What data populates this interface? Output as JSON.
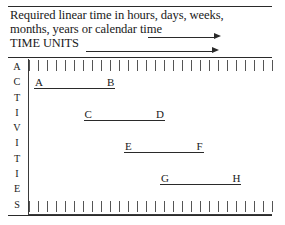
{
  "header": {
    "line1": "Required linear time in hours, days, weeks,",
    "line2": "months, years or calendar time",
    "line3": "TIME UNITS",
    "arrow1_name": "right-arrow",
    "arrow2_name": "right-arrow"
  },
  "axis": {
    "vertical_label": "ACTIVITIES",
    "vertical_letters": [
      "A",
      "C",
      "T",
      "I",
      "V",
      "I",
      "T",
      "I",
      "E",
      "S"
    ],
    "top_tick_count": 27,
    "bottom_tick_count": 27
  },
  "chart_data": {
    "type": "bar",
    "title": "Required linear time in hours, days, weeks, months, years or calendar time",
    "xlabel": "TIME UNITS",
    "ylabel": "ACTIVITIES",
    "grid": false,
    "legend": "none",
    "xlim": [
      0,
      27
    ],
    "categories": [
      "A-B",
      "C-D",
      "E-F",
      "G-H"
    ],
    "bars": [
      {
        "start_label": "A",
        "end_label": "B",
        "start": 0.6,
        "end": 9.6,
        "row": 0
      },
      {
        "start_label": "C",
        "end_label": "D",
        "start": 6.1,
        "end": 15.1,
        "row": 1
      },
      {
        "start_label": "E",
        "end_label": "F",
        "start": 10.6,
        "end": 19.4,
        "row": 2
      },
      {
        "start_label": "G",
        "end_label": "H",
        "start": 14.6,
        "end": 23.6,
        "row": 3
      }
    ],
    "annotations": [
      "Horizontal span bars represent activity durations along a linear time axis.",
      "Each bar is labelled at its start and end point."
    ]
  },
  "colors": {
    "ink": "#1a1a1a",
    "rule": "#2a2a2a",
    "tick": "#555555",
    "background": "#ffffff"
  }
}
